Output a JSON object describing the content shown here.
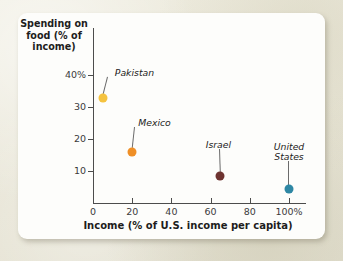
{
  "chart_data": {
    "type": "scatter",
    "title": "",
    "xlabel": "Income (% of U.S. income per capita)",
    "ylabel": "Spending on food (% of income)",
    "ylabel_lines": [
      "Spending on",
      "food (% of",
      "income)"
    ],
    "xlim": [
      0,
      110
    ],
    "ylim": [
      0,
      44
    ],
    "xticks": [
      0,
      20,
      40,
      60,
      80,
      100
    ],
    "xticklabels": [
      "0",
      "20",
      "40",
      "60",
      "80",
      "100%"
    ],
    "yticks": [
      10,
      20,
      30,
      40
    ],
    "yticklabels": [
      "10",
      "20",
      "30",
      "40%"
    ],
    "grid": false,
    "legend": "none",
    "points": [
      {
        "label": "Pakistan",
        "label_lines": [
          "Pakistan"
        ],
        "x": 5,
        "y": 33,
        "color": "#f5c33f"
      },
      {
        "label": "Mexico",
        "label_lines": [
          "Mexico"
        ],
        "x": 20,
        "y": 16,
        "color": "#ef8f26"
      },
      {
        "label": "Israel",
        "label_lines": [
          "Israel"
        ],
        "x": 65,
        "y": 8.5,
        "color": "#6e3330"
      },
      {
        "label": "United States",
        "label_lines": [
          "United",
          "States"
        ],
        "x": 100,
        "y": 4.5,
        "color": "#2e87a4"
      }
    ]
  },
  "figure": {
    "background_color": "#eceade",
    "card_color": "#fdfdfb",
    "axis_color": "#4c4c4c",
    "text_color": "#1d1d1d"
  }
}
